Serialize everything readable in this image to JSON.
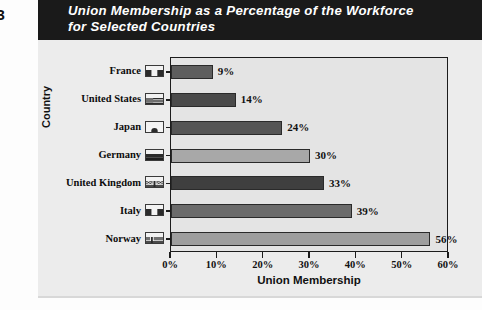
{
  "figure_number": "-3",
  "title": "Union Membership as a Percentage of the Workforce\nfor Selected Countries",
  "colors": {
    "banner_bg": "#1a1a1a",
    "banner_text": "#ffffff",
    "panel_bg": "#ececec",
    "plot_bg": "#e4e4e4",
    "axis": "#1c1c1c"
  },
  "chart_data": {
    "type": "bar",
    "orientation": "horizontal",
    "title": "Union Membership as a Percentage of the Workforce for Selected Countries",
    "xlabel": "Union Membership",
    "ylabel": "Country",
    "xlim": [
      0,
      60
    ],
    "xticks": [
      0,
      10,
      20,
      30,
      40,
      50,
      60
    ],
    "xtick_labels": [
      "0%",
      "10%",
      "20%",
      "30%",
      "40%",
      "50%",
      "60%"
    ],
    "grid": false,
    "legend": "none",
    "categories": [
      "France",
      "United States",
      "Japan",
      "Germany",
      "United Kingdom",
      "Italy",
      "Norway"
    ],
    "values": [
      9,
      14,
      24,
      30,
      33,
      39,
      56
    ],
    "data_labels": [
      "9%",
      "14%",
      "24%",
      "30%",
      "33%",
      "39%",
      "56%"
    ],
    "bars": [
      {
        "category": "France",
        "value": 9,
        "label": "9%",
        "color": "#5e5e5e",
        "flag": "flag-france"
      },
      {
        "category": "United States",
        "value": 14,
        "label": "14%",
        "color": "#4a4a4a",
        "flag": "flag-united-states"
      },
      {
        "category": "Japan",
        "value": 24,
        "label": "24%",
        "color": "#555555",
        "flag": "flag-japan"
      },
      {
        "category": "Germany",
        "value": 30,
        "label": "30%",
        "color": "#a8a8a8",
        "flag": "flag-germany"
      },
      {
        "category": "United Kingdom",
        "value": 33,
        "label": "33%",
        "color": "#3f3f3f",
        "flag": "flag-united-kingdom"
      },
      {
        "category": "Italy",
        "value": 39,
        "label": "39%",
        "color": "#6b6b6b",
        "flag": "flag-italy"
      },
      {
        "category": "Norway",
        "value": 56,
        "label": "56%",
        "color": "#9e9e9e",
        "flag": "flag-norway"
      }
    ]
  }
}
